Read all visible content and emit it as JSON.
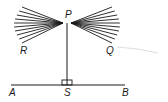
{
  "diagram": {
    "points": {
      "P": {
        "label": "P",
        "x": 67,
        "y": 23
      },
      "R": {
        "label": "R",
        "x": 22,
        "y": 50
      },
      "Q": {
        "label": "Q",
        "x": 109,
        "y": 51
      },
      "A": {
        "label": "A",
        "x": 12,
        "y": 93
      },
      "S": {
        "label": "S",
        "x": 67,
        "y": 93
      },
      "B": {
        "label": "B",
        "x": 124,
        "y": 93
      }
    },
    "baseline": {
      "x1": 11,
      "x2": 125,
      "y": 85
    },
    "perpendicular": {
      "from": "P",
      "to": "S",
      "right_angle_marker": true
    },
    "fan_left_count": 10,
    "fan_right_count": 10,
    "colors": {
      "ink": "#1a1a1a",
      "faint_curve": "#cfcfcf"
    }
  }
}
